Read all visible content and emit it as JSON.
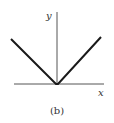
{
  "figure": {
    "caption": "(b)",
    "axes": {
      "x_label": "x",
      "y_label": "y"
    },
    "curve": {
      "description": "V-shaped graph (y = |x|) with vertex at origin",
      "stroke_color": "#1a1a1a"
    },
    "axis_color": "#555555"
  }
}
